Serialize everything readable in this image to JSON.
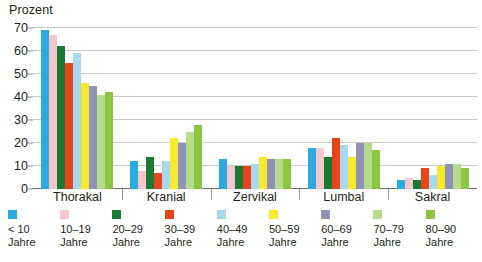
{
  "chart_data": {
    "type": "bar",
    "title": "",
    "ylabel": "Prozent",
    "xlabel": "",
    "ylim": [
      0,
      70
    ],
    "yticks": [
      0,
      10,
      20,
      30,
      40,
      50,
      60,
      70
    ],
    "grid": true,
    "legend_position": "bottom",
    "categories": [
      "Thorakal",
      "Kranial",
      "Zervikal",
      "Lumbal",
      "Sakral"
    ],
    "series": [
      {
        "name": "< 10 Jahre",
        "color": "#29ABE2",
        "values": [
          69,
          12,
          13,
          18,
          4
        ]
      },
      {
        "name": "10–19 Jahre",
        "color": "#F4C7CD",
        "values": [
          67,
          8,
          10,
          18,
          5
        ]
      },
      {
        "name": "20–29 Jahre",
        "color": "#1A7A33",
        "values": [
          62,
          14,
          10,
          14,
          4
        ]
      },
      {
        "name": "30–39 Jahre",
        "color": "#E8441A",
        "values": [
          55,
          7,
          10,
          22,
          9
        ]
      },
      {
        "name": "40–49 Jahre",
        "color": "#A8D8F0",
        "values": [
          59,
          12,
          11,
          19,
          6
        ]
      },
      {
        "name": "50–59 Jahre",
        "color": "#F7E92B",
        "values": [
          46,
          22,
          14,
          14,
          10
        ]
      },
      {
        "name": "60–69 Jahre",
        "color": "#9191B5",
        "values": [
          45,
          20,
          13,
          20,
          11
        ]
      },
      {
        "name": "70–79 Jahre",
        "color": "#B5DC8C",
        "values": [
          41,
          25,
          13,
          20,
          11
        ]
      },
      {
        "name": "80–90 Jahre",
        "color": "#8CC63F",
        "values": [
          42,
          28,
          13,
          17,
          9
        ]
      }
    ]
  },
  "axis": {
    "y_title": "Prozent"
  }
}
